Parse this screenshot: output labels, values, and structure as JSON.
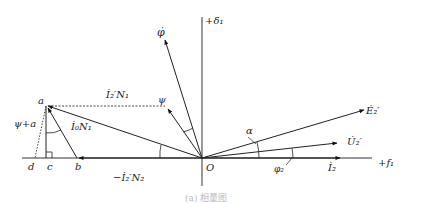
{
  "diagram": {
    "type": "phasor-diagram",
    "axes": {
      "horizontal_label": "+f₁",
      "vertical_label": "+δ₁",
      "origin_label": "O"
    },
    "vectors": [
      {
        "name": "phi",
        "label": "φ̇"
      },
      {
        "name": "psi",
        "label": "ψ"
      },
      {
        "name": "E2",
        "label": "Ė₂′"
      },
      {
        "name": "U2",
        "label": "U̇₂′"
      },
      {
        "name": "I2",
        "label": "İ₂"
      },
      {
        "name": "I2N1",
        "label": "İ₂′N₁"
      },
      {
        "name": "I0N1",
        "label": "İ₀N₁"
      },
      {
        "name": "minus_I2N2",
        "label": "−İ₂′N₂"
      }
    ],
    "points": {
      "a": "a",
      "b": "b",
      "c": "c",
      "d": "d"
    },
    "angles": {
      "alpha": "α",
      "phi2": "φ₂",
      "psi_plus_a": "ψ+a"
    },
    "caption": "(a) 相量图"
  }
}
